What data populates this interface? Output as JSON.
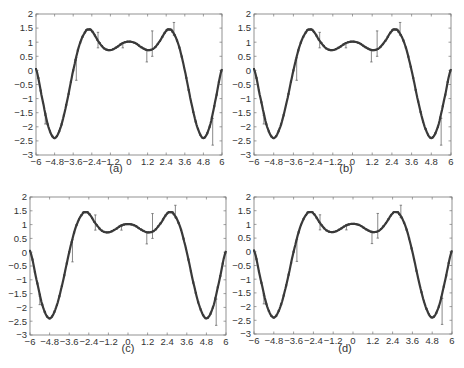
{
  "figure": {
    "panels": [
      {
        "id": "a",
        "caption": "(a)"
      },
      {
        "id": "b",
        "caption": "(b)"
      },
      {
        "id": "c",
        "caption": "(c)"
      },
      {
        "id": "d",
        "caption": "(d)"
      }
    ]
  },
  "colors": {
    "curve": "#3a3a3a",
    "errorbar": "#6a6a6a",
    "axis": "#777777",
    "text": "#333333"
  },
  "chart_data": [
    {
      "type": "line",
      "title": "(a)",
      "xlabel": "",
      "ylabel": "",
      "xlim": [
        -6,
        6
      ],
      "ylim": [
        -3,
        2
      ],
      "xticks": [
        "-6",
        "-4.8",
        "-3.6",
        "-2.4",
        "-1.2",
        "0",
        "1.2",
        "2.4",
        "3.6",
        "4.8",
        "6"
      ],
      "yticks": [
        "-3",
        "-2.5",
        "-2",
        "-1.5",
        "-1",
        "-0.5",
        "0",
        "0.5",
        "1",
        "1.5",
        "2"
      ],
      "grid": false,
      "series": [
        {
          "name": "fit",
          "x": [
            -6,
            -5.6,
            -5.2,
            -4.8,
            -4.4,
            -4.0,
            -3.6,
            -3.2,
            -2.8,
            -2.6,
            -2.4,
            -2.0,
            -1.6,
            -1.2,
            -0.8,
            -0.4,
            0,
            0.4,
            0.8,
            1.2,
            1.6,
            2.0,
            2.4,
            2.6,
            2.8,
            3.2,
            3.6,
            4.0,
            4.4,
            4.8,
            5.2,
            5.6,
            6
          ],
          "y": [
            0.05,
            -1.0,
            -2.0,
            -2.4,
            -2.0,
            -1.1,
            0.0,
            0.9,
            1.38,
            1.45,
            1.4,
            1.05,
            0.78,
            0.72,
            0.82,
            0.97,
            1.02,
            0.97,
            0.82,
            0.72,
            0.78,
            1.05,
            1.4,
            1.45,
            1.38,
            0.9,
            0.0,
            -1.1,
            -2.0,
            -2.4,
            -2.0,
            -1.0,
            0.05
          ]
        },
        {
          "name": "error_bars",
          "points": [
            {
              "x": -5.4,
              "low": -1.9,
              "high": -1.6
            },
            {
              "x": -3.4,
              "low": -0.35,
              "high": 0.45
            },
            {
              "x": -2.0,
              "low": 0.8,
              "high": 1.35
            },
            {
              "x": -0.4,
              "low": 0.8,
              "high": 0.95
            },
            {
              "x": 1.15,
              "low": 0.3,
              "high": 0.7
            },
            {
              "x": 1.5,
              "low": 0.5,
              "high": 1.4
            },
            {
              "x": 2.9,
              "low": 1.25,
              "high": 1.7
            },
            {
              "x": 5.4,
              "low": -2.65,
              "high": -1.7
            }
          ]
        }
      ]
    },
    {
      "type": "line",
      "title": "(b)",
      "xlim": [
        -6,
        6
      ],
      "ylim": [
        -3,
        2
      ],
      "xticks": [
        "-6",
        "-4.8",
        "-3.6",
        "-2.4",
        "-1.2",
        "0",
        "1.2",
        "2.4",
        "3.6",
        "4.8",
        "6"
      ],
      "yticks": [
        "-3",
        "-2.5",
        "-2",
        "-1.5",
        "-1",
        "-0.5",
        "0",
        "0.5",
        "1",
        "1.5",
        "2"
      ],
      "note": "same curve and error bars as (a)"
    },
    {
      "type": "line",
      "title": "(c)",
      "xlim": [
        -6,
        6
      ],
      "ylim": [
        -3,
        2
      ],
      "xticks": [
        "-6",
        "-4.8",
        "-3.6",
        "-2.4",
        "-1.2",
        "0",
        "1.2",
        "2.4",
        "3.6",
        "4.8",
        "6"
      ],
      "yticks": [
        "-3",
        "-2.5",
        "-2",
        "-1.5",
        "-1",
        "-0.5",
        "0",
        "0.5",
        "1",
        "1.5",
        "2"
      ],
      "note": "same curve and error bars as (a)"
    },
    {
      "type": "line",
      "title": "(d)",
      "xlim": [
        -6,
        6
      ],
      "ylim": [
        -3,
        2
      ],
      "xticks": [
        "-6",
        "-4.8",
        "-3.6",
        "-2.4",
        "-1.2",
        "0",
        "1.2",
        "2.4",
        "3.6",
        "4.8",
        "6"
      ],
      "yticks": [
        "-3",
        "-2.5",
        "-2",
        "-1.5",
        "-1",
        "-0.5",
        "0",
        "0.5",
        "1",
        "1.5",
        "2"
      ],
      "note": "same curve and error bars as (a)"
    }
  ]
}
